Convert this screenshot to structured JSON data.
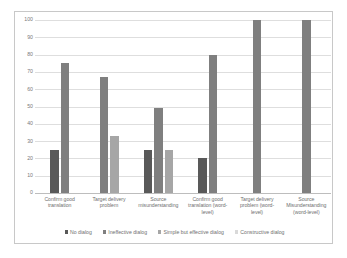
{
  "chart_data": {
    "type": "bar",
    "title": "",
    "xlabel": "",
    "ylabel": "",
    "ylim": [
      0,
      100
    ],
    "yticks": [
      0,
      10,
      20,
      30,
      40,
      50,
      60,
      70,
      80,
      90,
      100
    ],
    "ytick_labels": [
      "0",
      "10",
      "20",
      "30",
      "40",
      "50",
      "60",
      "70",
      "80",
      "90",
      "100"
    ],
    "grid": true,
    "legend_position": "bottom",
    "categories": [
      "Confirm good translation",
      "Target delivery problem",
      "Source misunderstanding",
      "Confirm good translation (word-level)",
      "Target delivery problem (word-level)",
      "Source Misunderstanding (word-level)"
    ],
    "category_lines": [
      [
        "Confirm good",
        "translation"
      ],
      [
        "Target delivery",
        "problem"
      ],
      [
        "Source",
        "misunderstanding"
      ],
      [
        "Confirm good",
        "translation (word-",
        "level)"
      ],
      [
        "Target delivery",
        "problem (word-",
        "level)"
      ],
      [
        "Source",
        "Misunderstanding",
        "(word-level)"
      ]
    ],
    "series": [
      {
        "name": "No dialog",
        "color": "#595959",
        "values": [
          25,
          null,
          25,
          20,
          null,
          null
        ]
      },
      {
        "name": "Ineffective dialog",
        "color": "#7f7f7f",
        "values": [
          75,
          67,
          49,
          80,
          100,
          100
        ]
      },
      {
        "name": "Simple but effective dialog",
        "color": "#a6a6a6",
        "values": [
          null,
          33,
          25,
          null,
          null,
          null
        ]
      },
      {
        "name": "Constructive dialog",
        "color": "#d9d9d9",
        "values": [
          null,
          null,
          null,
          null,
          null,
          null
        ]
      }
    ]
  }
}
